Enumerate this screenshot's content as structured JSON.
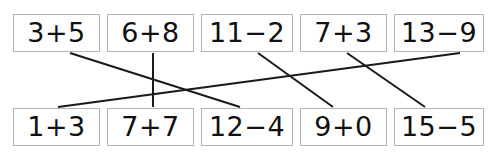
{
  "worksheet": {
    "title": "Addition and subtraction matching worksheet",
    "background_color": "#ffffff",
    "box_border_color": "#b4b4b4",
    "line_color": "#1a1a1a",
    "text_color": "#111111",
    "width": 500,
    "height": 160
  },
  "top_row": {
    "label": "top-row-expressions",
    "items": [
      {
        "text": "3+5",
        "x": 13,
        "y": 14,
        "w": 87,
        "h": 38
      },
      {
        "text": "6+8",
        "x": 107,
        "y": 14,
        "w": 87,
        "h": 38
      },
      {
        "text": "11−2",
        "x": 201,
        "y": 14,
        "w": 92,
        "h": 38
      },
      {
        "text": "7+3",
        "x": 300,
        "y": 14,
        "w": 87,
        "h": 38
      },
      {
        "text": "13−9",
        "x": 394,
        "y": 14,
        "w": 90,
        "h": 38
      }
    ]
  },
  "bottom_row": {
    "label": "bottom-row-expressions",
    "items": [
      {
        "text": "1+3",
        "x": 13,
        "y": 108,
        "w": 87,
        "h": 38
      },
      {
        "text": "7+7",
        "x": 107,
        "y": 108,
        "w": 87,
        "h": 38
      },
      {
        "text": "12−4",
        "x": 201,
        "y": 108,
        "w": 92,
        "h": 38
      },
      {
        "text": "9+0",
        "x": 300,
        "y": 108,
        "w": 87,
        "h": 38
      },
      {
        "text": "15−5",
        "x": 394,
        "y": 108,
        "w": 90,
        "h": 38
      }
    ]
  },
  "connections": [
    {
      "name": "link-3plus5-to-12minus4",
      "from": "3+5",
      "to": "12−4",
      "x1": 70,
      "y1": 53,
      "x2": 240,
      "y2": 107
    },
    {
      "name": "link-6plus8-to-7plus7",
      "from": "6+8",
      "to": "7+7",
      "x1": 153,
      "y1": 53,
      "x2": 153,
      "y2": 107
    },
    {
      "name": "link-11minus2-to-9plus0",
      "from": "11−2",
      "to": "9+0",
      "x1": 258,
      "y1": 53,
      "x2": 333,
      "y2": 107
    },
    {
      "name": "link-7plus3-to-15minus5",
      "from": "7+3",
      "to": "15−5",
      "x1": 347,
      "y1": 53,
      "x2": 425,
      "y2": 107
    },
    {
      "name": "link-13minus9-to-1plus3",
      "from": "13−9",
      "to": "1+3",
      "x1": 460,
      "y1": 53,
      "x2": 58,
      "y2": 107
    }
  ]
}
